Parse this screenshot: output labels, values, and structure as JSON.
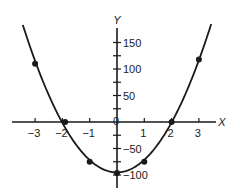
{
  "chart_data": {
    "type": "line",
    "title": "",
    "xlabel": "X",
    "ylabel": "Y",
    "xlim": [
      -3.6,
      3.6
    ],
    "ylim": [
      -120,
      180
    ],
    "grid": false,
    "legend": null,
    "x_ticks": [
      -3,
      -2,
      -1,
      0,
      1,
      2,
      3
    ],
    "x_tick_labels": [
      "−3",
      "−2",
      "−1",
      "0",
      "1",
      "2",
      "3"
    ],
    "y_ticks_major": [
      -100,
      -50,
      50,
      100,
      150
    ],
    "y_tick_labels": [
      "−100",
      "−50",
      "50",
      "100",
      "150"
    ],
    "y_ticks_minor": [
      -75,
      -25,
      25,
      75,
      125
    ],
    "origin_label": "0",
    "series": [
      {
        "name": "parabola",
        "marker": "circle",
        "color": "#1a1a1a",
        "points": [
          {
            "x": -3,
            "y": 110
          },
          {
            "x": -1.9,
            "y": 0
          },
          {
            "x": -1,
            "y": -75
          },
          {
            "x": 0,
            "y": -96
          },
          {
            "x": 1,
            "y": -75
          },
          {
            "x": 2,
            "y": 0
          },
          {
            "x": 3,
            "y": 118
          }
        ],
        "curve_x_range": [
          -3.45,
          3.45
        ]
      }
    ]
  },
  "colors": {
    "ink": "#1a1a1a",
    "background": "#ffffff"
  }
}
